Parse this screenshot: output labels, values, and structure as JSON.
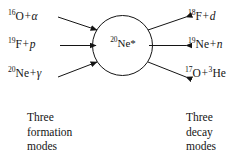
{
  "diagram": {
    "nucleus": {
      "mass_number": "20",
      "symbol": "Ne",
      "excited_marker": "*"
    },
    "formation_channels": [
      {
        "mass_number": "16",
        "element": "O",
        "plus": "+",
        "particle": "α",
        "arrow": "arrow-right-icon"
      },
      {
        "mass_number": "19",
        "element": "F",
        "plus": "+",
        "particle": "p",
        "arrow": "arrow-right-icon"
      },
      {
        "mass_number": "20",
        "element": "Ne",
        "plus": "+",
        "particle": "γ",
        "arrow": "arrow-right-icon"
      }
    ],
    "decay_channels": [
      {
        "mass_number": "18",
        "element": "F",
        "plus": "+",
        "particle": "d",
        "arrow": "arrow-right-icon"
      },
      {
        "mass_number": "19",
        "element": "Ne",
        "plus": "+",
        "particle": "n",
        "arrow": "arrow-right-icon"
      },
      {
        "mass_number": "17",
        "element": "O",
        "plus": "+",
        "particle_mass_number": "3",
        "particle": "He",
        "arrow": "arrow-right-icon"
      }
    ],
    "captions": {
      "left": {
        "line1": "Three",
        "line2": "formation",
        "line3": "modes"
      },
      "right": {
        "line1": "Three",
        "line2": "decay",
        "line3": "modes"
      }
    },
    "colors": {
      "ink": "#141414",
      "background": "#ffffff"
    }
  }
}
